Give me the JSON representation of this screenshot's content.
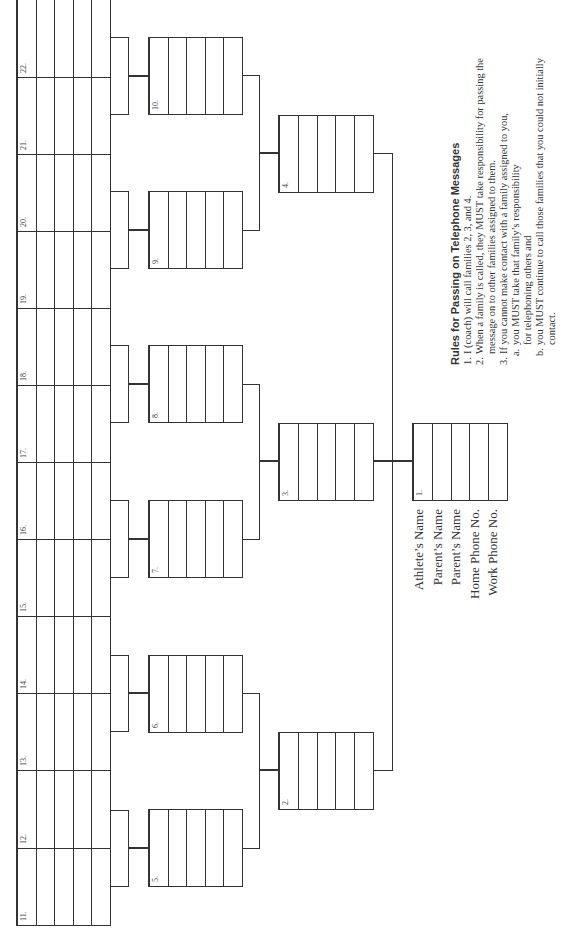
{
  "document": {
    "orientation": "rotated -90deg (landscape page shown in portrait)",
    "line_color": "#333333"
  },
  "tree": {
    "root": {
      "number": "1.",
      "children": [
        "2.",
        "3.",
        "4."
      ]
    },
    "level2": [
      {
        "number": "2.",
        "children": [
          "5.",
          "6."
        ]
      },
      {
        "number": "3.",
        "children": [
          "7.",
          "8."
        ]
      },
      {
        "number": "4.",
        "children": [
          "9.",
          "10."
        ]
      }
    ],
    "level3": [
      {
        "number": "5.",
        "children": [
          "11.",
          "12."
        ]
      },
      {
        "number": "6.",
        "children": [
          "13.",
          "14."
        ]
      },
      {
        "number": "7.",
        "children": [
          "15.",
          "16."
        ]
      },
      {
        "number": "8.",
        "children": [
          "17.",
          "18."
        ]
      },
      {
        "number": "9.",
        "children": [
          "19.",
          "20."
        ]
      },
      {
        "number": "10.",
        "children": [
          "21.",
          "22."
        ]
      }
    ],
    "leaves": [
      "11.",
      "12.",
      "13.",
      "14.",
      "15.",
      "16.",
      "17.",
      "18.",
      "19.",
      "20.",
      "21.",
      "22."
    ]
  },
  "cards": {
    "c1": "1.",
    "c2": "2.",
    "c3": "3.",
    "c4": "4.",
    "c5": "5.",
    "c6": "6.",
    "c7": "7.",
    "c8": "8.",
    "c9": "9.",
    "c10": "10.",
    "c11": "11.",
    "c12": "12.",
    "c13": "13.",
    "c14": "14.",
    "c15": "15.",
    "c16": "16.",
    "c17": "17.",
    "c18": "18.",
    "c19": "19.",
    "c20": "20.",
    "c21": "21.",
    "c22": "22."
  },
  "card_fields": [
    "Athlete's Name",
    "Parent's Name",
    "Parent's Name",
    "Home Phone No.",
    "Work Phone No."
  ],
  "legend": {
    "l0": "Athlete’s Name",
    "l1": "Parent’s Name",
    "l2": "Parent’s Name",
    "l3": "Home Phone No.",
    "l4": "Work Phone No."
  },
  "rules": {
    "title": "Rules for Passing on Telephone Messages",
    "items": [
      {
        "marker": "1.",
        "text": "I (coach) will call families 2, 3, and 4."
      },
      {
        "marker": "2.",
        "text": "When a family is called, they MUST take responsibility for passing the message on to other families assigned to them."
      },
      {
        "marker": "3.",
        "text": "If you cannot make contact with a family assigned to you,"
      }
    ],
    "subitems": [
      {
        "marker": "a.",
        "text": "you MUST take that family’s responsibility for telephoning others and"
      },
      {
        "marker": "b.",
        "text": "you MUST continue to call those families that you could not initially contact."
      }
    ]
  }
}
